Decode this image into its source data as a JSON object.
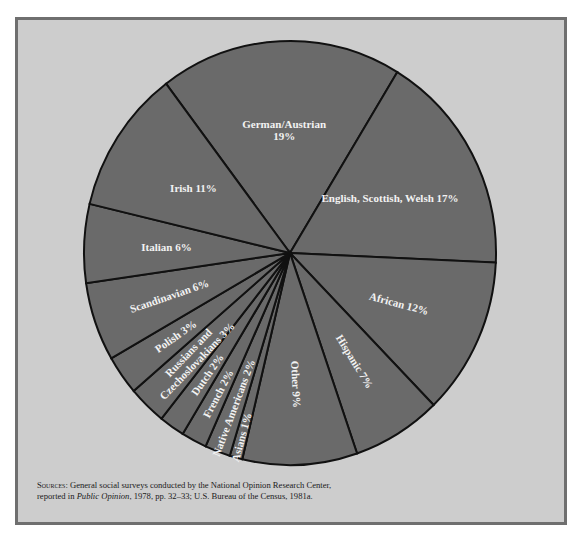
{
  "chart_data": {
    "type": "pie",
    "title": "",
    "start_label": "German/Austrian",
    "direction": "clockwise",
    "slices": [
      {
        "label": "German/Austrian",
        "label_lines": [
          "German/Austrian",
          "19%"
        ],
        "value": 19
      },
      {
        "label": "English, Scottish, Welsh",
        "label_lines": [
          "English, Scottish, Welsh 17%"
        ],
        "value": 17
      },
      {
        "label": "African",
        "label_lines": [
          "African 12%"
        ],
        "value": 12
      },
      {
        "label": "Hispanic",
        "label_lines": [
          "Hispanic 7%"
        ],
        "value": 7
      },
      {
        "label": "Other",
        "label_lines": [
          "Other 9%"
        ],
        "value": 9
      },
      {
        "label": "Asians",
        "label_lines": [
          "Asians 1%"
        ],
        "value": 1
      },
      {
        "label": "Native Americans",
        "label_lines": [
          "Native Americans 2%"
        ],
        "value": 2
      },
      {
        "label": "French",
        "label_lines": [
          "French 2%"
        ],
        "value": 2
      },
      {
        "label": "Dutch",
        "label_lines": [
          "Dutch 2%"
        ],
        "value": 2
      },
      {
        "label": "Russians and Czechoslovakians",
        "label_lines": [
          "Russians and",
          "Czechoslovakians 3%"
        ],
        "value": 3
      },
      {
        "label": "Polish",
        "label_lines": [
          "Polish 3%"
        ],
        "value": 3
      },
      {
        "label": "Scandinavian",
        "label_lines": [
          "Scandinavian 6%"
        ],
        "value": 6
      },
      {
        "label": "Italian",
        "label_lines": [
          "Italian 6%"
        ],
        "value": 6
      },
      {
        "label": "Irish",
        "label_lines": [
          "Irish 11%"
        ],
        "value": 11
      }
    ],
    "unit": "%",
    "colors": {
      "slice": "#6a6a6a",
      "background": "#cdcdcd",
      "border": "#6f6f6f",
      "label": "#f2f2f2"
    }
  },
  "source": {
    "prefix": "Sources:",
    "text_1": " General social surveys conducted by the National Opinion Research Center, reported in ",
    "italic": "Public Opinion",
    "text_2": ", 1978, pp. 32–33; U.S. Bureau of the Census, 1981a."
  }
}
